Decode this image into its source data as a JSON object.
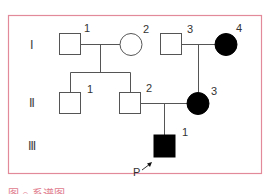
{
  "diagram": {
    "type": "pedigree",
    "frame_color": "#e28a9a",
    "generations": [
      {
        "roman": "Ⅰ",
        "y": 45
      },
      {
        "roman": "Ⅱ",
        "y": 103
      },
      {
        "roman": "Ⅲ",
        "y": 146
      }
    ],
    "individuals": [
      {
        "id": "I-1",
        "label": "1",
        "sex": "male",
        "affected": false
      },
      {
        "id": "I-2",
        "label": "2",
        "sex": "female",
        "affected": false
      },
      {
        "id": "I-3",
        "label": "3",
        "sex": "male",
        "affected": false
      },
      {
        "id": "I-4",
        "label": "4",
        "sex": "female",
        "affected": true
      },
      {
        "id": "II-1",
        "label": "1",
        "sex": "male",
        "affected": false
      },
      {
        "id": "II-2",
        "label": "2",
        "sex": "male",
        "affected": false
      },
      {
        "id": "II-3",
        "label": "3",
        "sex": "female",
        "affected": true
      },
      {
        "id": "III-1",
        "label": "1",
        "sex": "male",
        "affected": true,
        "proband": true
      }
    ],
    "proband_marker": "P",
    "caption": "图 ○ 系谱图"
  }
}
